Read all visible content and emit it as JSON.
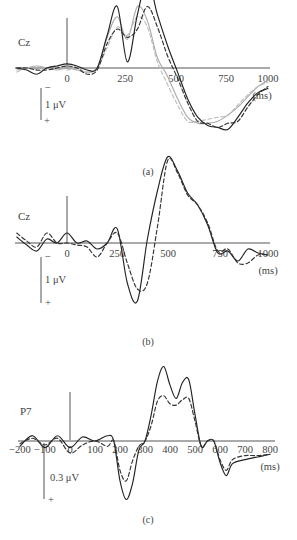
{
  "figure": {
    "panels": [
      {
        "id": "a",
        "caption": "(a)",
        "channel": "Cz",
        "unit": "(ms)",
        "scale_label": "1 μV",
        "scale_neg": "−",
        "scale_pos": "+",
        "ticks": [
          "0",
          "250",
          "500",
          "750",
          "1000"
        ]
      },
      {
        "id": "b",
        "caption": "(b)",
        "channel": "Cz",
        "unit": "(ms)",
        "scale_label": "1 μV",
        "scale_neg": "−",
        "scale_pos": "+",
        "ticks": [
          "0",
          "250",
          "500",
          "750",
          "1000"
        ]
      },
      {
        "id": "c",
        "caption": "(c)",
        "channel": "P7",
        "unit": "(ms)",
        "scale_label": "0.3 μV",
        "scale_pos": "+",
        "ticks": [
          "−200",
          "−100",
          "0",
          "100",
          "200",
          "300",
          "400",
          "500",
          "600",
          "700",
          "800"
        ]
      }
    ]
  },
  "chart_data": [
    {
      "type": "line",
      "title": "(a)",
      "channel": "Cz",
      "xlabel": "(ms)",
      "ylabel": "1 μV (negative up)",
      "xlim": [
        -250,
        1000
      ],
      "x_ticks": [
        0,
        250,
        500,
        750,
        1000
      ],
      "grid": false,
      "polarity": "negative up",
      "x": [
        -250,
        -200,
        -150,
        -100,
        -50,
        0,
        50,
        100,
        150,
        200,
        250,
        300,
        350,
        400,
        450,
        500,
        550,
        600,
        650,
        700,
        750,
        800,
        850,
        900,
        950,
        1000
      ],
      "series": [
        {
          "name": "solid-black",
          "style": "solid",
          "color": "#222222",
          "values": [
            0.0,
            0.1,
            0.3,
            0.0,
            -0.1,
            -0.2,
            -0.1,
            0.1,
            0.0,
            -1.6,
            -3.0,
            -0.3,
            -2.6,
            -4.3,
            -2.6,
            -1.1,
            0.2,
            1.5,
            2.4,
            2.8,
            2.9,
            3.0,
            2.4,
            1.7,
            1.2,
            1.0
          ]
        },
        {
          "name": "dashed-black",
          "style": "dashed",
          "color": "#333333",
          "values": [
            0.0,
            0.0,
            0.1,
            0.1,
            0.0,
            -0.1,
            0.0,
            0.3,
            0.1,
            -1.2,
            -1.9,
            -1.5,
            -1.9,
            -3.0,
            -2.0,
            -0.6,
            0.5,
            1.7,
            2.6,
            2.7,
            2.9,
            2.7,
            2.6,
            1.9,
            1.3,
            0.9
          ]
        },
        {
          "name": "solid-gray",
          "style": "solid",
          "color": "#aaaaaa",
          "values": [
            0.1,
            0.0,
            -0.1,
            0.0,
            0.1,
            0.0,
            0.1,
            0.2,
            0.0,
            -1.5,
            -2.5,
            -1.4,
            -3.0,
            -2.3,
            -0.5,
            0.4,
            1.5,
            2.4,
            2.7,
            2.7,
            2.6,
            2.3,
            1.9,
            1.4,
            0.9,
            0.6
          ]
        },
        {
          "name": "dashed-gray",
          "style": "dashed",
          "color": "#bbbbbb",
          "values": [
            0.2,
            0.0,
            0.1,
            0.0,
            -0.1,
            0.1,
            0.0,
            0.2,
            0.0,
            -1.0,
            -2.0,
            -1.6,
            -2.5,
            -2.0,
            -0.3,
            0.8,
            1.8,
            2.6,
            2.6,
            2.5,
            2.4,
            2.3,
            1.8,
            1.3,
            0.9,
            0.7
          ]
        }
      ]
    },
    {
      "type": "line",
      "title": "(b)",
      "channel": "Cz",
      "xlabel": "(ms)",
      "ylabel": "1 μV (negative up)",
      "xlim": [
        -250,
        1000
      ],
      "x_ticks": [
        0,
        250,
        500,
        750,
        1000
      ],
      "grid": false,
      "polarity": "negative up",
      "x": [
        -250,
        -200,
        -150,
        -100,
        -50,
        0,
        50,
        100,
        150,
        200,
        250,
        300,
        350,
        400,
        450,
        500,
        550,
        600,
        650,
        700,
        750,
        800,
        850,
        900,
        950,
        1000
      ],
      "series": [
        {
          "name": "solid",
          "style": "solid",
          "color": "#222222",
          "values": [
            -0.3,
            0.1,
            0.4,
            -0.2,
            0.0,
            -0.5,
            0.0,
            -0.1,
            0.3,
            0.0,
            -0.7,
            2.0,
            2.9,
            -0.2,
            -2.6,
            -4.3,
            -3.6,
            -2.5,
            -1.9,
            -0.9,
            0.5,
            0.4,
            0.9,
            0.3,
            0.5,
            0.6
          ]
        },
        {
          "name": "dashed",
          "style": "dashed",
          "color": "#333333",
          "values": [
            -0.5,
            -0.1,
            0.2,
            -0.5,
            0.0,
            0.0,
            0.1,
            0.2,
            0.7,
            0.0,
            -0.5,
            1.0,
            2.3,
            2.0,
            -0.8,
            -4.1,
            -3.5,
            -2.4,
            -1.9,
            -1.0,
            0.4,
            0.3,
            1.0,
            1.0,
            0.6,
            0.6
          ]
        }
      ]
    },
    {
      "type": "line",
      "title": "(c)",
      "channel": "P7",
      "xlabel": "(ms)",
      "ylabel": "0.3 μV (negative up)",
      "xlim": [
        -200,
        800
      ],
      "x_ticks": [
        -200,
        -100,
        0,
        100,
        200,
        300,
        400,
        500,
        600,
        700,
        800
      ],
      "grid": false,
      "polarity": "negative up",
      "x": [
        -200,
        -150,
        -100,
        -50,
        0,
        50,
        100,
        150,
        175,
        200,
        225,
        250,
        275,
        300,
        325,
        350,
        375,
        400,
        425,
        450,
        475,
        500,
        525,
        550,
        575,
        600,
        625,
        650,
        700,
        750,
        800
      ],
      "series": [
        {
          "name": "solid",
          "style": "solid",
          "color": "#222222",
          "values": [
            0.04,
            -0.04,
            0.05,
            -0.04,
            0.05,
            -0.03,
            0.0,
            -0.04,
            0.0,
            0.3,
            0.44,
            0.32,
            0.07,
            0.0,
            -0.2,
            -0.45,
            -0.56,
            -0.42,
            -0.32,
            -0.44,
            -0.46,
            -0.2,
            0.04,
            0.0,
            0.0,
            0.16,
            0.26,
            0.17,
            0.14,
            0.12,
            0.1
          ]
        },
        {
          "name": "dashed",
          "style": "dashed",
          "color": "#333333",
          "values": [
            0.02,
            -0.02,
            0.03,
            -0.02,
            0.09,
            0.03,
            0.0,
            0.04,
            0.0,
            0.22,
            0.3,
            0.15,
            0.04,
            0.0,
            -0.12,
            -0.3,
            -0.34,
            -0.28,
            -0.27,
            -0.31,
            -0.32,
            -0.15,
            0.04,
            0.0,
            0.0,
            0.14,
            0.22,
            0.14,
            0.11,
            0.11,
            0.1
          ]
        }
      ]
    }
  ]
}
